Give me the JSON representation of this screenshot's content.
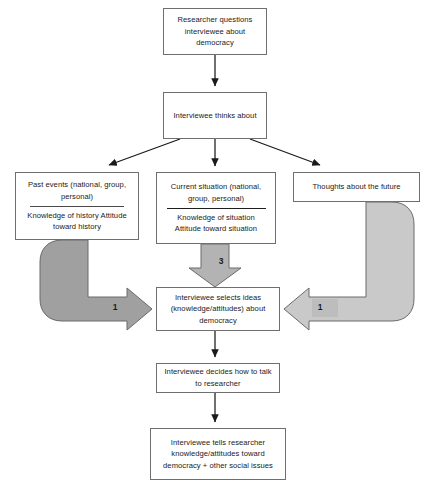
{
  "diagram": {
    "colors": {
      "box_border": "#6f6f6f",
      "connector": "#1a1a1a",
      "block_arrow_dark": "#a0a0a0",
      "block_arrow_light": "#c9c9c9",
      "block_arrow_mid": "#b3b3b3",
      "block_arrow_stroke": "#6b6b6b",
      "background": "#ffffff"
    },
    "nodes": {
      "researcher": {
        "lines": "Researcher questions interviewee about democracy"
      },
      "thinks": {
        "lines": "Interviewee thinks about"
      },
      "past": {
        "top": "Past events (national, group, personal)",
        "bottom": "Knowledge of history Attitude toward history"
      },
      "current": {
        "top": "Current situation (national, group, personal)",
        "bottom": "Knowledge of situation Attitude toward situation"
      },
      "future": {
        "lines": "Thoughts about the future"
      },
      "selects": {
        "lines": "Interviewee selects ideas (knowledge/attitudes) about democracy"
      },
      "decides": {
        "lines": "Interviewee decides how to talk to researcher"
      },
      "tells": {
        "lines": "Interviewee tells researcher knowledge/attitudes toward democracy + other social issues"
      }
    },
    "arrow_labels": {
      "left": "1",
      "right": "1",
      "middle": "3"
    }
  }
}
